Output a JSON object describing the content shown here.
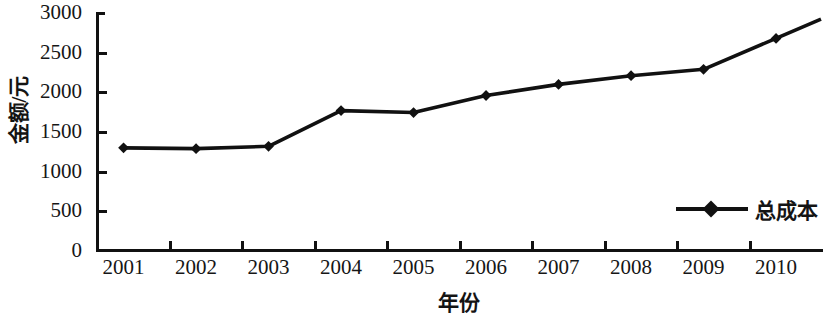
{
  "chart_data": {
    "type": "line",
    "title": "",
    "xlabel": "年份",
    "ylabel": "金额/元",
    "categories": [
      "2001",
      "2002",
      "2003",
      "2004",
      "2005",
      "2006",
      "2007",
      "2008",
      "2009",
      "2010"
    ],
    "series": [
      {
        "name": "总成本",
        "values": [
          1300,
          1290,
          1320,
          1770,
          1745,
          1960,
          2100,
          2210,
          2290,
          2680
        ],
        "color": "#111111",
        "marker": "diamond"
      }
    ],
    "ylim": [
      0,
      3000
    ],
    "y_ticks": [
      0,
      500,
      1000,
      1500,
      2000,
      2500,
      3000
    ],
    "y_tick_labels": [
      "0",
      "500",
      "1000",
      "1500",
      "2000",
      "2500",
      "3000"
    ],
    "grid": false,
    "legend_position": "inside-lower-right",
    "frame": "left-and-bottom-spines"
  },
  "legend": {
    "entries": [
      {
        "label": "总成本",
        "symbol": "line-with-diamond-marker"
      }
    ]
  },
  "axes": {
    "y_title": "金额/元",
    "x_title": "年份"
  }
}
